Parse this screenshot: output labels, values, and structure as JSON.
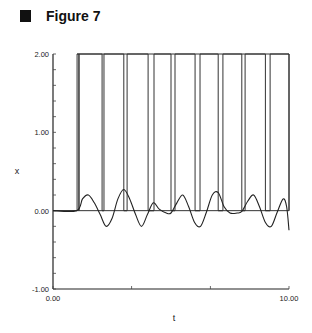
{
  "figure": {
    "label": "Figure 7"
  },
  "chart_data": {
    "type": "line",
    "title": "",
    "xlabel": "t",
    "ylabel": "x",
    "xlim": [
      0,
      10
    ],
    "ylim": [
      -1,
      2
    ],
    "x_tick_labels": [
      "0.00",
      "10.00"
    ],
    "y_tick_labels": [
      "2.00",
      "1.00",
      "0.00",
      "-1.00"
    ],
    "x_ticks_unlabeled": [
      3.33,
      6.67
    ],
    "y_minor_step": 0.2,
    "grid": false,
    "legend": "none",
    "series": [
      {
        "name": "pulse train",
        "style": "step",
        "low": 0,
        "high": 2,
        "pulse_edges": [
          [
            1.02,
            1.1
          ],
          [
            2.08,
            2.16
          ],
          [
            3.0,
            3.14
          ],
          [
            4.03,
            4.28
          ],
          [
            5.0,
            5.17
          ],
          [
            6.02,
            6.23
          ],
          [
            7.0,
            7.2
          ],
          [
            8.0,
            8.14
          ],
          [
            9.0,
            9.2
          ],
          [
            10.0,
            10.0
          ]
        ]
      },
      {
        "name": "oscillation",
        "style": "line",
        "points": [
          [
            0.0,
            0.0
          ],
          [
            1.0,
            0.0
          ],
          [
            1.25,
            0.15
          ],
          [
            1.5,
            0.2
          ],
          [
            1.75,
            0.1
          ],
          [
            2.0,
            -0.05
          ],
          [
            2.25,
            -0.2
          ],
          [
            2.5,
            -0.1
          ],
          [
            2.75,
            0.15
          ],
          [
            3.0,
            0.27
          ],
          [
            3.25,
            0.15
          ],
          [
            3.5,
            -0.05
          ],
          [
            3.75,
            -0.2
          ],
          [
            4.0,
            -0.05
          ],
          [
            4.25,
            0.1
          ],
          [
            4.5,
            0.02
          ],
          [
            4.8,
            -0.03
          ],
          [
            5.0,
            -0.03
          ],
          [
            5.25,
            0.1
          ],
          [
            5.5,
            0.2
          ],
          [
            5.75,
            0.05
          ],
          [
            6.0,
            -0.15
          ],
          [
            6.25,
            -0.2
          ],
          [
            6.5,
            -0.02
          ],
          [
            6.75,
            0.2
          ],
          [
            7.0,
            0.23
          ],
          [
            7.25,
            0.05
          ],
          [
            7.5,
            -0.03
          ],
          [
            7.8,
            -0.03
          ],
          [
            8.0,
            -0.01
          ],
          [
            8.25,
            0.12
          ],
          [
            8.5,
            0.2
          ],
          [
            8.75,
            0.05
          ],
          [
            9.0,
            -0.15
          ],
          [
            9.25,
            -0.2
          ],
          [
            9.5,
            -0.02
          ],
          [
            9.75,
            0.15
          ],
          [
            9.9,
            0.05
          ],
          [
            10.0,
            -0.25
          ]
        ]
      }
    ]
  }
}
